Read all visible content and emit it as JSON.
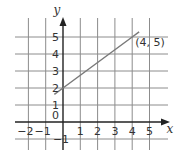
{
  "chart_data": {
    "type": "line",
    "title": "",
    "xlabel": "x",
    "ylabel": "y",
    "xlim": [
      -2.8,
      6
    ],
    "ylim": [
      -1.6,
      6
    ],
    "grid": true,
    "x_ticks": [
      -2,
      -1,
      1,
      2,
      3,
      4,
      5
    ],
    "x_tick_labels": [
      "−2",
      "−1",
      "1",
      "2",
      "3",
      "4",
      "5"
    ],
    "y_ticks": [
      -1,
      1,
      2,
      3,
      4,
      5
    ],
    "y_tick_labels": [
      "−1",
      "1",
      "2",
      "3",
      "4",
      "5"
    ],
    "origin_label": "0",
    "series": [
      {
        "name": "line",
        "x": [
          -0.5,
          0,
          4,
          4.4
        ],
        "y": [
          1.625,
          2,
          5,
          5.3
        ],
        "color": "#7a7a7a"
      }
    ],
    "annotations": [
      {
        "text": "(4, 5)",
        "x": 4,
        "y": 5
      }
    ]
  },
  "colors": {
    "grid": "#8c8c8c",
    "axis": "#222222",
    "line": "#7a7a7a",
    "text": "#333333"
  }
}
